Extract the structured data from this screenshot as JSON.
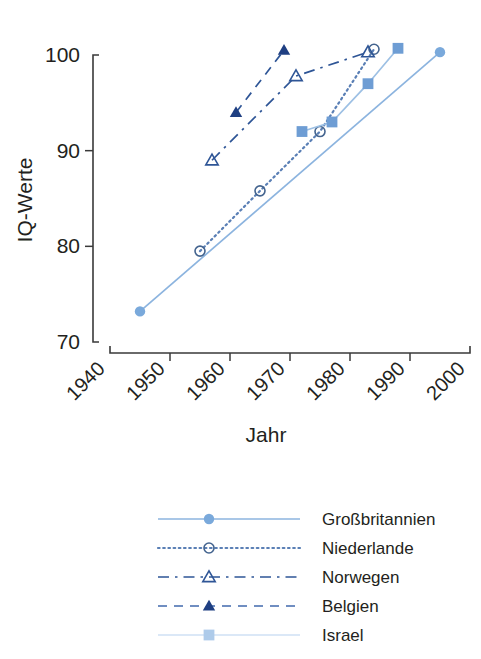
{
  "chart_data": {
    "type": "line",
    "title": "",
    "xlabel": "Jahr",
    "ylabel": "IQ-Werte",
    "xlim": [
      1940,
      2000
    ],
    "ylim": [
      70,
      100
    ],
    "xticks": [
      "1940",
      "1950",
      "1960",
      "1970",
      "1980",
      "1990",
      "2000"
    ],
    "yticks": [
      "70",
      "80",
      "90",
      "100"
    ],
    "grid": false,
    "legend_position": "bottom",
    "series": [
      {
        "name": "Großbritannien",
        "marker": "filled-circle",
        "linestyle": "solid",
        "color": "#8cb4df",
        "marker_color": "#7aa9db",
        "x": [
          1945,
          1995
        ],
        "y": [
          73.2,
          100.3
        ]
      },
      {
        "name": "Niederlande",
        "marker": "open-circle",
        "linestyle": "dotted",
        "color": "#5a7fb5",
        "marker_color": "#44648f",
        "x": [
          1955,
          1965,
          1975,
          1984
        ],
        "y": [
          79.5,
          85.8,
          92.0,
          100.6
        ]
      },
      {
        "name": "Norwegen",
        "marker": "open-triangle",
        "linestyle": "dashdot",
        "color": "#2e5596",
        "marker_color": "#2e5596",
        "x": [
          1957,
          1971,
          1983
        ],
        "y": [
          89.0,
          97.8,
          100.3
        ]
      },
      {
        "name": "Belgien",
        "marker": "filled-triangle",
        "linestyle": "dashed",
        "color": "#2e5596",
        "marker_color": "#1f3f82",
        "x": [
          1961,
          1969
        ],
        "y": [
          94.0,
          100.5
        ]
      },
      {
        "name": "Israel",
        "marker": "filled-square",
        "linestyle": "solid",
        "color": "#9dc0e4",
        "marker_color": "#6e9dd4",
        "x": [
          1972,
          1977,
          1983,
          1988
        ],
        "y": [
          92.0,
          93.0,
          97.0,
          100.7
        ]
      }
    ]
  },
  "legend": {
    "items": [
      {
        "label": "Großbritannien",
        "marker": "filled-circle",
        "linestyle": "solid",
        "color": "#8cb4df",
        "marker_color": "#7aa9db"
      },
      {
        "label": "Niederlande",
        "marker": "open-circle",
        "linestyle": "dotted",
        "color": "#5a7fb5",
        "marker_color": "#44648f"
      },
      {
        "label": "Norwegen",
        "marker": "open-triangle",
        "linestyle": "dashdot",
        "color": "#2e5596",
        "marker_color": "#2e5596"
      },
      {
        "label": "Belgien",
        "marker": "filled-triangle",
        "linestyle": "dashed",
        "color": "#4169ad",
        "marker_color": "#1f3f82"
      },
      {
        "label": "Israel",
        "marker": "filled-square",
        "linestyle": "solid",
        "color": "#cfe1f4",
        "marker_color": "#aecbea"
      }
    ]
  }
}
